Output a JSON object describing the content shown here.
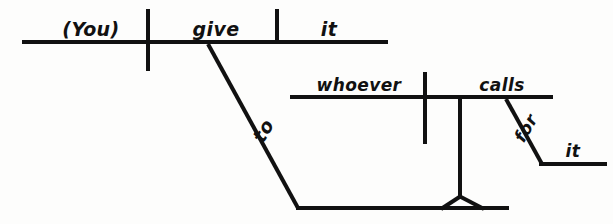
{
  "diagram": {
    "type": "reed-kellogg-sentence-diagram",
    "sentence": "(You) give it to whoever calls for it.",
    "ink_color": "#111111",
    "background_color": "#fdfdfc",
    "canvas": {
      "width": 613,
      "height": 224
    },
    "words": {
      "subject": "(You)",
      "verb": "give",
      "direct_object": "it",
      "preposition_main": "to",
      "clause_subject": "whoever",
      "clause_verb": "calls",
      "preposition_clause": "for",
      "prep_object_clause": "it"
    },
    "labels": [
      {
        "name": "subject",
        "text": "(You)",
        "x": 91,
        "y": 36,
        "size": "lg"
      },
      {
        "name": "verb",
        "text": "give",
        "x": 216,
        "y": 36,
        "size": "lg"
      },
      {
        "name": "direct-object",
        "text": "it",
        "x": 329,
        "y": 36,
        "size": "lg"
      },
      {
        "name": "preposition-to",
        "text": "to",
        "x": 269,
        "y": 134,
        "size": "lg",
        "rotate": -60
      },
      {
        "name": "clause-subject",
        "text": "whoever",
        "x": 359,
        "y": 91,
        "size": "sm"
      },
      {
        "name": "clause-verb",
        "text": "calls",
        "x": 502,
        "y": 91,
        "size": "sm"
      },
      {
        "name": "preposition-for",
        "text": "for",
        "x": 531,
        "y": 131,
        "size": "sm",
        "rotate": -60
      },
      {
        "name": "prep-object-it",
        "text": "it",
        "x": 573,
        "y": 157,
        "size": "sm"
      }
    ],
    "strokes": [
      {
        "name": "main-baseline",
        "x1": 22,
        "y1": 42,
        "x2": 388,
        "y2": 42,
        "w": 4
      },
      {
        "name": "subject-verb-divider",
        "x1": 148,
        "y1": 9,
        "x2": 148,
        "y2": 71,
        "w": 4
      },
      {
        "name": "object-divider",
        "x1": 277,
        "y1": 9,
        "x2": 277,
        "y2": 43,
        "w": 4
      },
      {
        "name": "preposition-to-slant",
        "x1": 208,
        "y1": 44,
        "x2": 298,
        "y2": 208,
        "w": 4
      },
      {
        "name": "clause-platform-line",
        "x1": 297,
        "y1": 208,
        "x2": 509,
        "y2": 208,
        "w": 4
      },
      {
        "name": "clause-support-stem",
        "x1": 460,
        "y1": 98,
        "x2": 460,
        "y2": 196,
        "w": 4
      },
      {
        "name": "stand-left-leg",
        "x1": 460,
        "y1": 196,
        "x2": 441,
        "y2": 209,
        "w": 4
      },
      {
        "name": "stand-right-leg",
        "x1": 460,
        "y1": 196,
        "x2": 484,
        "y2": 209,
        "w": 4
      },
      {
        "name": "clause-baseline",
        "x1": 290,
        "y1": 97,
        "x2": 553,
        "y2": 97,
        "w": 4
      },
      {
        "name": "clause-subject-verb-divider",
        "x1": 425,
        "y1": 72,
        "x2": 425,
        "y2": 144,
        "w": 4
      },
      {
        "name": "preposition-for-slant",
        "x1": 506,
        "y1": 99,
        "x2": 542,
        "y2": 164,
        "w": 4
      },
      {
        "name": "prep-object-baseline",
        "x1": 540,
        "y1": 164,
        "x2": 607,
        "y2": 164,
        "w": 4
      }
    ]
  }
}
